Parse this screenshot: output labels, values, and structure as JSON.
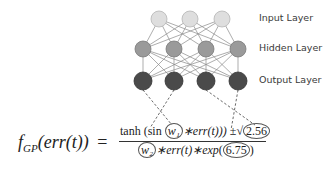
{
  "layers": {
    "input": {
      "label": "Input Layer",
      "nodes": 3,
      "color": "#dedede"
    },
    "hidden": {
      "label": "Hidden Layer",
      "nodes": 4,
      "color": "#9a9a9a"
    },
    "output": {
      "label": "Output Layer",
      "nodes": 4,
      "color": "#4a4a4a"
    }
  },
  "formula": {
    "lhs_f": "f",
    "lhs_sub": "GP",
    "lhs_arg": "(err(t))",
    "equals": "=",
    "num_tanh": "tanh",
    "num_sin": "(sin",
    "num_w1": "w₁",
    "num_mid": "∗err(t)))",
    "num_pm": "±",
    "num_sqrt": "√",
    "num_const": "2.56",
    "den_w2": "w₂",
    "den_mid": "∗err(t)∗exp",
    "den_const": "6.75",
    "den_close": ")"
  }
}
